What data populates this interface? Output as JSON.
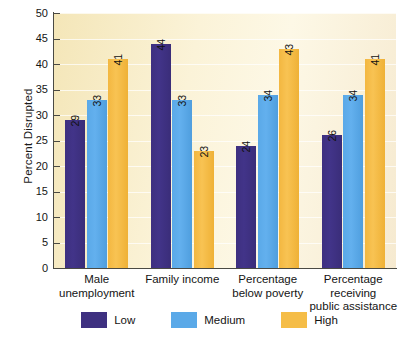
{
  "chart_data": {
    "type": "bar",
    "title": "",
    "xlabel": "",
    "ylabel": "Percent Disrupted",
    "ylim": [
      0,
      50
    ],
    "ytick_step": 5,
    "yticks": [
      50,
      45,
      40,
      35,
      30,
      25,
      20,
      15,
      10,
      5,
      0
    ],
    "grid": true,
    "legend_position": "bottom",
    "categories": [
      "Male unemployment",
      "Family income",
      "Percentage below poverty",
      "Percentage receiving public assistance"
    ],
    "category_lines": [
      [
        "Male",
        "unemployment"
      ],
      [
        "Family income"
      ],
      [
        "Percentage",
        "below poverty"
      ],
      [
        "Percentage",
        "receiving",
        "public assistance"
      ]
    ],
    "series": [
      {
        "name": "Low",
        "color": "#3e3080",
        "values": [
          29,
          44,
          24,
          26
        ]
      },
      {
        "name": "Medium",
        "color": "#5aa9e8",
        "values": [
          33,
          33,
          34,
          34
        ]
      },
      {
        "name": "High",
        "color": "#f5bd47",
        "values": [
          41,
          23,
          43,
          41
        ]
      }
    ]
  },
  "axis": {
    "y_title": "Percent Disrupted"
  },
  "legend": {
    "items": [
      {
        "label": "Low",
        "swatch": "low"
      },
      {
        "label": "Medium",
        "swatch": "medium"
      },
      {
        "label": "High",
        "swatch": "high"
      }
    ]
  },
  "colors": {
    "plot_background": "#f8edc8",
    "page_background": "#ffffff",
    "axis": "#4a4a44",
    "low": "#3e3080",
    "medium": "#5aa9e8",
    "high": "#f5bd47"
  }
}
